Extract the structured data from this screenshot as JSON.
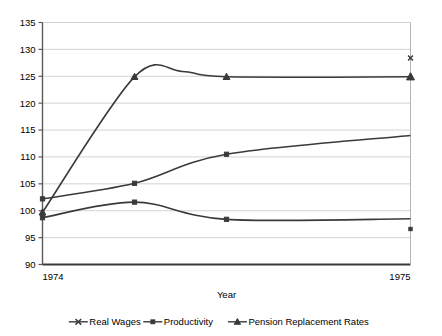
{
  "chart_data": {
    "type": "line",
    "title": "",
    "xlabel": "Year",
    "ylabel": "",
    "xlim": [
      1974,
      1975
    ],
    "ylim": [
      90,
      135
    ],
    "ytick_labels": [
      "135",
      "130",
      "125",
      "120",
      "115",
      "110",
      "105",
      "100",
      "95",
      "90"
    ],
    "ytick_values": [
      135,
      130,
      125,
      120,
      115,
      110,
      105,
      100,
      95,
      90
    ],
    "xtick_labels": [
      "1974",
      "1975"
    ],
    "xtick_values": [
      1974,
      1975
    ],
    "grid": true,
    "legend_position": "bottom",
    "x": [
      1974.0,
      1974.25,
      1974.5,
      1975.0
    ],
    "series": [
      {
        "name": "Real Wages",
        "marker": "x",
        "values": [
          99.7,
          124.9,
          124.9,
          128.4
        ],
        "endpoint_value": 128.4
      },
      {
        "name": "Productivity",
        "marker": "square",
        "values": [
          102.2,
          105.1,
          110.5,
          114.0
        ],
        "endpoint_value": 96.6
      },
      {
        "name": "Pension Replacement Rates",
        "marker": "triangle",
        "values": [
          98.7,
          101.6,
          98.4,
          98.5
        ],
        "endpoint_value": 124.9
      }
    ],
    "curves": [
      {
        "name": "upper-curve",
        "marker": "triangle",
        "points": [
          [
            1974.0,
            99.7
          ],
          [
            1974.25,
            124.9
          ],
          [
            1974.38,
            125.9
          ],
          [
            1974.5,
            124.9
          ],
          [
            1975.0,
            124.9
          ]
        ],
        "marker_points": [
          [
            1974.0,
            99.7
          ],
          [
            1974.25,
            124.9
          ],
          [
            1974.5,
            124.9
          ],
          [
            1975.0,
            124.9
          ]
        ]
      },
      {
        "name": "middle-curve",
        "marker": "square",
        "points": [
          [
            1974.0,
            102.2
          ],
          [
            1974.25,
            105.1
          ],
          [
            1974.5,
            110.5
          ],
          [
            1975.0,
            114.0
          ]
        ],
        "marker_points": [
          [
            1974.0,
            102.2
          ],
          [
            1974.25,
            105.1
          ],
          [
            1974.5,
            110.5
          ]
        ]
      },
      {
        "name": "lower-curve",
        "marker": "square",
        "points": [
          [
            1974.0,
            98.7
          ],
          [
            1974.25,
            101.6
          ],
          [
            1974.5,
            98.4
          ],
          [
            1975.0,
            98.5
          ]
        ],
        "marker_points": [
          [
            1974.0,
            98.7
          ],
          [
            1974.25,
            101.6
          ],
          [
            1974.5,
            98.4
          ]
        ]
      }
    ],
    "isolated_markers": [
      {
        "name": "real-wages-endpoint",
        "marker": "x",
        "x": 1975.0,
        "y": 128.4
      },
      {
        "name": "pension-endpoint",
        "marker": "triangle",
        "x": 1975.0,
        "y": 124.9
      },
      {
        "name": "productivity-endpoint",
        "marker": "square",
        "x": 1975.0,
        "y": 96.6
      }
    ],
    "colors": {
      "series_line": "#3a3a3a",
      "gridline": "#c8c8c8",
      "axis": "#5a5a5a",
      "text": "#000000",
      "background": "#ffffff"
    }
  },
  "legend": {
    "items": [
      {
        "label": "Real Wages",
        "marker": "x"
      },
      {
        "label": "Productivity",
        "marker": "square"
      },
      {
        "label": "Pension Replacement Rates",
        "marker": "triangle"
      }
    ]
  }
}
